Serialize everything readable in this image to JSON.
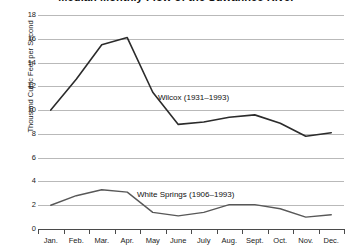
{
  "chart_data": {
    "type": "line",
    "title": "Median Monthly Flow of the Suwannee River",
    "xlabel": "",
    "ylabel": "Thousand Cubic Feet per Second",
    "categories": [
      "Jan.",
      "Feb.",
      "Mar.",
      "Apr.",
      "May",
      "June",
      "July",
      "Aug.",
      "Sept.",
      "Oct.",
      "Nov.",
      "Dec."
    ],
    "ylim": [
      0,
      18
    ],
    "ytick_values": [
      0,
      2,
      4,
      6,
      8,
      10,
      12,
      14,
      16,
      18
    ],
    "ytick_labels": [
      "0",
      "2",
      "4",
      "6",
      "8",
      "10",
      "12",
      "14",
      "16",
      "18"
    ],
    "grid": true,
    "legend_position": "inline-annotation",
    "series": [
      {
        "name": "Wilcox (1931–1993)",
        "label": "Wilcox (1931–1993)",
        "color": "#2b2b2b",
        "line_width": 1.6,
        "values": [
          10.0,
          12.6,
          15.5,
          16.1,
          11.5,
          8.8,
          9.0,
          9.4,
          9.6,
          8.9,
          7.8,
          8.1
        ]
      },
      {
        "name": "White Springs (1906–1993)",
        "label": "White Springs (1906–1993)",
        "color": "#585858",
        "line_width": 1.4,
        "values": [
          2.0,
          2.8,
          3.3,
          3.1,
          1.4,
          1.1,
          1.4,
          2.05,
          2.05,
          1.7,
          1.0,
          1.2
        ]
      }
    ]
  },
  "annotations": {
    "wilcox": "Wilcox (1931–1993)",
    "white_springs": "White Springs (1906–1993)"
  },
  "colors": {
    "gridline": "#b9b9b9",
    "axis": "#4a4a4a",
    "text": "#1a1a1a",
    "background": "#ffffff",
    "series_primary": "#2b2b2b",
    "series_secondary": "#585858"
  }
}
